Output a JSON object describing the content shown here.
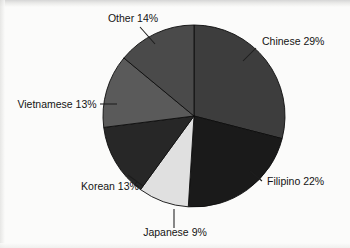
{
  "chart_data": {
    "type": "pie",
    "title": "",
    "subtitle": "",
    "xlabel": "",
    "ylabel": "",
    "legend_position": "none",
    "grid": false,
    "labels_format": "name percent",
    "start_angle_deg": 0,
    "direction": "clockwise",
    "categories": [
      "Chinese",
      "Filipino",
      "Japanese",
      "Korean",
      "Vietnamese",
      "Other"
    ],
    "values": [
      29,
      22,
      9,
      13,
      13,
      14
    ],
    "total": 100,
    "units": "percent",
    "slices": [
      {
        "name": "Chinese",
        "value": 29,
        "label": "Chinese 29%",
        "color": "#3d3d3d",
        "start_deg": 0,
        "end_deg": 104.4,
        "label_x": 262,
        "label_y": 45,
        "label_anchor": "start",
        "leader_x1": 256,
        "leader_y1": 48,
        "leader_x2": 243,
        "leader_y2": 61
      },
      {
        "name": "Filipino",
        "value": 22,
        "label": "Filipino 22%",
        "color": "#1a1a1a",
        "start_deg": 104.4,
        "end_deg": 183.6,
        "label_x": 267,
        "label_y": 185,
        "label_anchor": "start",
        "leader_x1": 262,
        "leader_y1": 181,
        "leader_x2": 250,
        "leader_y2": 171
      },
      {
        "name": "Japanese",
        "value": 9,
        "label": "Japanese 9%",
        "color": "#e0e0e0",
        "start_deg": 183.6,
        "end_deg": 216.0,
        "label_x": 175,
        "label_y": 236,
        "label_anchor": "middle",
        "leader_x1": 174,
        "leader_y1": 228,
        "leader_x2": 174,
        "leader_y2": 209
      },
      {
        "name": "Korean",
        "value": 13,
        "label": "Korean 13%",
        "color": "#272727",
        "start_deg": 216.0,
        "end_deg": 262.8,
        "label_x": 110,
        "label_y": 190,
        "label_anchor": "middle",
        "leader_x1": 143,
        "leader_y1": 186,
        "leader_x2": 128,
        "leader_y2": 175
      },
      {
        "name": "Vietnamese",
        "value": 13,
        "label": "Vietnamese 13%",
        "color": "#5a5a5a",
        "start_deg": 262.8,
        "end_deg": 309.6,
        "label_x": 57,
        "label_y": 108,
        "label_anchor": "middle",
        "leader_x1": 100,
        "leader_y1": 104,
        "leader_x2": 117,
        "leader_y2": 104
      },
      {
        "name": "Other",
        "value": 14,
        "label": "Other 14%",
        "color": "#4a4a4a",
        "start_deg": 309.6,
        "end_deg": 360.0,
        "label_x": 133,
        "label_y": 22,
        "label_anchor": "middle",
        "leader_x1": 140,
        "leader_y1": 27,
        "leader_x2": 155,
        "leader_y2": 44
      }
    ],
    "geometry": {
      "center_x": 194,
      "center_y": 116,
      "radius": 91
    },
    "colors": {
      "background": "#fbfbfa",
      "slice_outline": "#0d0d0d",
      "label_text": "#141414",
      "leader_line": "#1d1d1d"
    }
  }
}
